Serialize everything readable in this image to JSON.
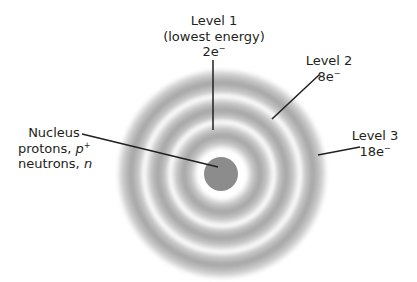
{
  "diagram": {
    "type": "atomic-energy-levels",
    "colors": {
      "ring": "#969696",
      "nucleus": "#8c8c8c",
      "line": "#231f20",
      "text": "#231f20",
      "background": "#ffffff"
    },
    "levels": [
      {
        "name": "Level 1",
        "description": "(lowest energy)",
        "electrons": "2e",
        "charge": "−"
      },
      {
        "name": "Level 2",
        "electrons": "8e",
        "charge": "−"
      },
      {
        "name": "Level 3",
        "electrons": "18e",
        "charge": "−"
      }
    ],
    "nucleus": {
      "title": "Nucleus",
      "protons_label": "protons, ",
      "protons_symbol": "p",
      "protons_charge": "+",
      "neutrons_label": "neutrons, ",
      "neutrons_symbol": "n"
    },
    "leader_lines": {
      "level1": {
        "x1": 213,
        "y1": 60,
        "x2": 213,
        "y2": 130
      },
      "level2": {
        "x1": 319,
        "y1": 75,
        "x2": 272,
        "y2": 119
      },
      "level3": {
        "x1": 360,
        "y1": 147,
        "x2": 318,
        "y2": 155
      },
      "nucleus": {
        "x1": 82,
        "y1": 134,
        "x2": 218,
        "y2": 167
      }
    }
  }
}
